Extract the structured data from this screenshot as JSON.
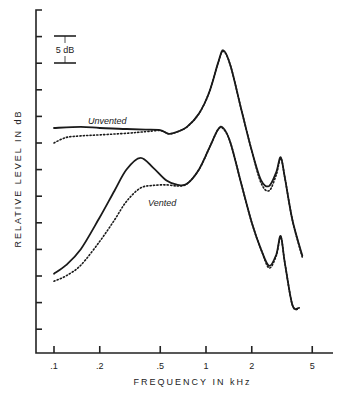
{
  "chart_data": {
    "type": "line",
    "title": "",
    "xlabel": "FREQUENCY IN kHz",
    "ylabel": "RELATIVE LEVEL IN dB",
    "x_scale": "log",
    "xlim": [
      0.1,
      6
    ],
    "x_ticks": [
      0.1,
      0.2,
      0.5,
      1,
      2,
      5
    ],
    "x_tick_labels": [
      ".1",
      ".2",
      ".5",
      "1",
      "2",
      "5"
    ],
    "y_tick_step_db": 5,
    "y_tick_count": 13,
    "ylim": [
      0,
      64.5
    ],
    "grid": false,
    "legend": "none (curves labeled inline)",
    "scale_bar": {
      "label": "5 dB",
      "value_db": 5
    },
    "annotations": [
      {
        "text": "Unvented",
        "near_freq_khz": 0.22
      },
      {
        "text": "Vented",
        "near_freq_khz": 0.5
      }
    ],
    "series": [
      {
        "name": "Unvented (solid)",
        "style": "solid",
        "points": [
          [
            0.1,
            42.3
          ],
          [
            0.15,
            42.5
          ],
          [
            0.2,
            42.3
          ],
          [
            0.3,
            42.1
          ],
          [
            0.4,
            42.0
          ],
          [
            0.5,
            41.9
          ],
          [
            0.57,
            41.2
          ],
          [
            0.65,
            41.6
          ],
          [
            0.75,
            42.5
          ],
          [
            0.9,
            45.0
          ],
          [
            1.05,
            49.0
          ],
          [
            1.2,
            54.5
          ],
          [
            1.3,
            56.9
          ],
          [
            1.45,
            54.0
          ],
          [
            1.7,
            46.0
          ],
          [
            2.0,
            38.0
          ],
          [
            2.3,
            32.5
          ],
          [
            2.6,
            31.4
          ],
          [
            2.9,
            34.0
          ],
          [
            3.1,
            36.8
          ],
          [
            3.3,
            33.0
          ],
          [
            3.7,
            25.0
          ],
          [
            4.3,
            18.3
          ]
        ]
      },
      {
        "name": "Unvented (dotted)",
        "style": "dotted",
        "points": [
          [
            0.1,
            39.5
          ],
          [
            0.12,
            40.5
          ],
          [
            0.15,
            40.8
          ],
          [
            0.2,
            41.0
          ],
          [
            0.3,
            41.3
          ],
          [
            0.4,
            41.6
          ],
          [
            0.5,
            41.8
          ],
          [
            0.57,
            41.2
          ],
          [
            0.65,
            41.6
          ],
          [
            0.75,
            42.5
          ],
          [
            0.9,
            45.0
          ],
          [
            1.05,
            49.0
          ],
          [
            1.2,
            54.5
          ],
          [
            1.3,
            56.7
          ],
          [
            1.45,
            54.0
          ],
          [
            1.7,
            46.0
          ],
          [
            2.0,
            38.0
          ],
          [
            2.3,
            32.0
          ],
          [
            2.6,
            30.5
          ],
          [
            2.9,
            33.5
          ],
          [
            3.1,
            36.6
          ],
          [
            3.3,
            33.0
          ],
          [
            3.7,
            25.0
          ],
          [
            4.3,
            18.0
          ]
        ]
      },
      {
        "name": "Vented (solid)",
        "style": "solid",
        "points": [
          [
            0.1,
            14.9
          ],
          [
            0.12,
            16.5
          ],
          [
            0.15,
            19.5
          ],
          [
            0.2,
            25.5
          ],
          [
            0.25,
            30.5
          ],
          [
            0.3,
            34.5
          ],
          [
            0.37,
            36.7
          ],
          [
            0.45,
            34.8
          ],
          [
            0.55,
            32.4
          ],
          [
            0.65,
            31.6
          ],
          [
            0.75,
            31.8
          ],
          [
            0.9,
            34.5
          ],
          [
            1.05,
            38.5
          ],
          [
            1.2,
            42.0
          ],
          [
            1.3,
            42.3
          ],
          [
            1.45,
            39.5
          ],
          [
            1.7,
            32.0
          ],
          [
            2.0,
            24.5
          ],
          [
            2.3,
            19.5
          ],
          [
            2.6,
            16.4
          ],
          [
            2.9,
            18.5
          ],
          [
            3.1,
            22.0
          ],
          [
            3.3,
            17.0
          ],
          [
            3.7,
            9.0
          ],
          [
            4.1,
            8.5
          ]
        ]
      },
      {
        "name": "Vented (dotted)",
        "style": "dotted",
        "points": [
          [
            0.1,
            13.5
          ],
          [
            0.12,
            14.5
          ],
          [
            0.15,
            16.5
          ],
          [
            0.2,
            21.0
          ],
          [
            0.25,
            25.0
          ],
          [
            0.3,
            28.5
          ],
          [
            0.37,
            31.0
          ],
          [
            0.45,
            31.5
          ],
          [
            0.55,
            31.6
          ],
          [
            0.65,
            31.4
          ],
          [
            0.75,
            31.8
          ],
          [
            0.9,
            34.5
          ],
          [
            1.05,
            38.5
          ],
          [
            1.2,
            42.0
          ],
          [
            1.3,
            42.1
          ],
          [
            1.45,
            39.5
          ],
          [
            1.7,
            32.0
          ],
          [
            2.0,
            24.5
          ],
          [
            2.3,
            19.5
          ],
          [
            2.6,
            16.0
          ],
          [
            2.9,
            18.3
          ],
          [
            3.1,
            21.8
          ],
          [
            3.3,
            17.0
          ],
          [
            3.7,
            9.0
          ],
          [
            4.1,
            8.3
          ]
        ]
      }
    ]
  }
}
